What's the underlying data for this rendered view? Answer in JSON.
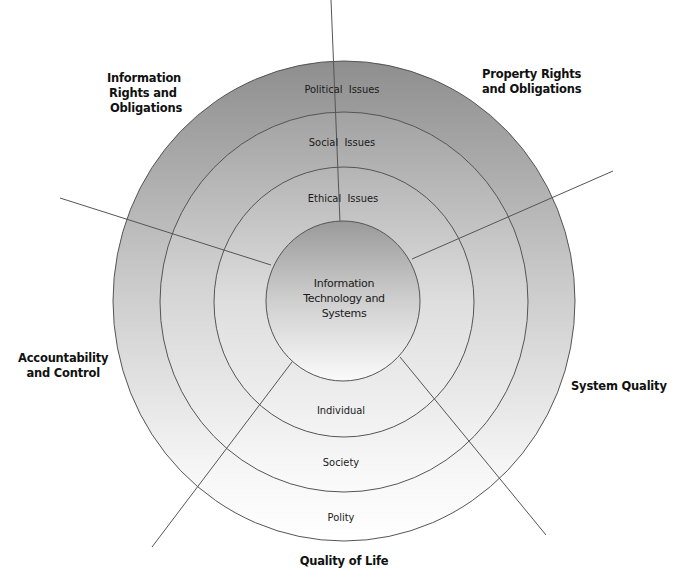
{
  "diagram": {
    "center": {
      "lines": [
        "Information",
        "Technology and",
        "Systems"
      ]
    },
    "upper_ring_labels": {
      "outer": "Political  Issues",
      "middle": "Social  Issues",
      "inner": "Ethical  Issues"
    },
    "lower_ring_labels": {
      "inner": "Individual",
      "middle": "Society",
      "outer": "Polity"
    },
    "dimensions": {
      "information_rights": [
        "Information",
        "Rights and",
        "Obligations"
      ],
      "property_rights": [
        "Property Rights",
        "and Obligations"
      ],
      "accountability": [
        "Accountability",
        "and Control"
      ],
      "system_quality": [
        "System Quality"
      ],
      "quality_of_life": [
        "Quality of Life"
      ]
    },
    "colors": {
      "line": "#555555",
      "ring_dark": "#8c8c8c",
      "ring_light": "#ffffff",
      "text": "#111111"
    }
  }
}
